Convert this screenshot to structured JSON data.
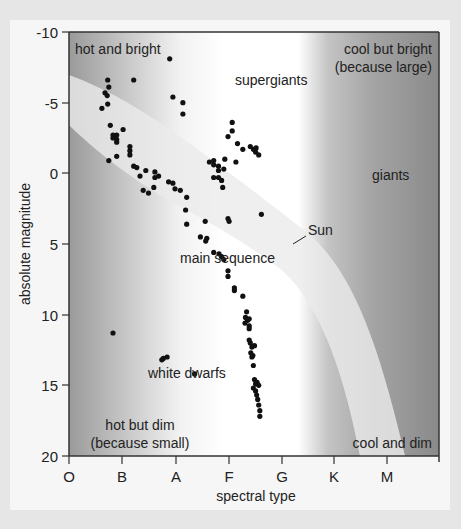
{
  "chart_data": {
    "type": "scatter",
    "title": "",
    "xlabel": "spectral type",
    "ylabel": "absolute magnitude",
    "x_categories": [
      "O",
      "B",
      "A",
      "F",
      "G",
      "K",
      "M"
    ],
    "y_ticks": [
      -10,
      -5,
      0,
      5,
      10,
      15,
      20
    ],
    "ylim": [
      -10,
      20
    ],
    "y_inverted": true,
    "grid": false,
    "legend": null,
    "annotations": {
      "hot_and_bright": "hot and bright",
      "cool_but_bright_1": "cool but bright",
      "cool_but_bright_2": "(because large)",
      "hot_but_dim_1": "hot but dim",
      "hot_but_dim_2": "(because small)",
      "cool_and_dim": "cool and dim",
      "supergiants": "supergiants",
      "giants": "giants",
      "main_sequence": "main sequence",
      "white_dwarfs": "white dwarfs",
      "sun": "Sun"
    },
    "points": [
      {
        "x": 0.62,
        "y": -4.6
      },
      {
        "x": 0.73,
        "y": -6.6
      },
      {
        "x": 0.68,
        "y": -5.7
      },
      {
        "x": 0.72,
        "y": -5.5
      },
      {
        "x": 0.75,
        "y": -6.1
      },
      {
        "x": 0.73,
        "y": -4.9
      },
      {
        "x": 0.78,
        "y": -3.4
      },
      {
        "x": 0.83,
        "y": -2.7
      },
      {
        "x": 0.83,
        "y": -2.5
      },
      {
        "x": 0.9,
        "y": -2.7
      },
      {
        "x": 0.9,
        "y": -2.4
      },
      {
        "x": 0.9,
        "y": -2.2
      },
      {
        "x": 0.75,
        "y": -0.9
      },
      {
        "x": 0.9,
        "y": -1.2
      },
      {
        "x": 1.02,
        "y": -3.1
      },
      {
        "x": 1.22,
        "y": -6.6
      },
      {
        "x": 1.15,
        "y": -1.9
      },
      {
        "x": 1.15,
        "y": -1.6
      },
      {
        "x": 1.15,
        "y": -1.3
      },
      {
        "x": 1.22,
        "y": -0.5
      },
      {
        "x": 1.28,
        "y": -0.4
      },
      {
        "x": 1.34,
        "y": 0.2
      },
      {
        "x": 1.45,
        "y": -0.2
      },
      {
        "x": 1.4,
        "y": 1.2
      },
      {
        "x": 1.5,
        "y": 1.4
      },
      {
        "x": 1.6,
        "y": 1.0
      },
      {
        "x": 1.62,
        "y": -0.1
      },
      {
        "x": 1.62,
        "y": 0.3
      },
      {
        "x": 1.69,
        "y": 0.2
      },
      {
        "x": 1.88,
        "y": 0.6
      },
      {
        "x": 1.96,
        "y": 0.7
      },
      {
        "x": 1.9,
        "y": -8.1
      },
      {
        "x": 1.96,
        "y": -5.4
      },
      {
        "x": 2.15,
        "y": -5.0
      },
      {
        "x": 2.15,
        "y": -4.2
      },
      {
        "x": 2.0,
        "y": 1.1
      },
      {
        "x": 2.1,
        "y": 1.2
      },
      {
        "x": 2.22,
        "y": 1.7
      },
      {
        "x": 2.2,
        "y": 2.6
      },
      {
        "x": 2.22,
        "y": 3.6
      },
      {
        "x": 2.57,
        "y": 3.4
      },
      {
        "x": 2.6,
        "y": 4.6
      },
      {
        "x": 2.58,
        "y": 4.8
      },
      {
        "x": 2.48,
        "y": 4.5
      },
      {
        "x": 3.0,
        "y": 3.2
      },
      {
        "x": 3.02,
        "y": 3.4
      },
      {
        "x": 2.65,
        "y": -0.8
      },
      {
        "x": 2.73,
        "y": -0.6
      },
      {
        "x": 2.73,
        "y": -0.9
      },
      {
        "x": 2.82,
        "y": -0.5
      },
      {
        "x": 2.82,
        "y": 0.3
      },
      {
        "x": 2.73,
        "y": 0.3
      },
      {
        "x": 2.82,
        "y": -0.2
      },
      {
        "x": 2.88,
        "y": 0.5
      },
      {
        "x": 2.92,
        "y": -0.3
      },
      {
        "x": 2.94,
        "y": -1.0
      },
      {
        "x": 2.9,
        "y": 1.0
      },
      {
        "x": 3.0,
        "y": -2.6
      },
      {
        "x": 3.08,
        "y": -3.6
      },
      {
        "x": 3.08,
        "y": -3.0
      },
      {
        "x": 3.15,
        "y": -0.8
      },
      {
        "x": 3.18,
        "y": -2.1
      },
      {
        "x": 3.28,
        "y": -1.7
      },
      {
        "x": 3.42,
        "y": -1.9
      },
      {
        "x": 3.48,
        "y": -1.7
      },
      {
        "x": 3.53,
        "y": -1.8
      },
      {
        "x": 3.52,
        "y": -1.5
      },
      {
        "x": 3.58,
        "y": -1.3
      },
      {
        "x": 3.63,
        "y": 2.9
      },
      {
        "x": 2.73,
        "y": 5.6
      },
      {
        "x": 2.83,
        "y": 5.7
      },
      {
        "x": 2.88,
        "y": 5.9
      },
      {
        "x": 2.92,
        "y": 6.1
      },
      {
        "x": 3.0,
        "y": 6.9
      },
      {
        "x": 3.0,
        "y": 7.3
      },
      {
        "x": 3.12,
        "y": 8.3
      },
      {
        "x": 3.12,
        "y": 8.1
      },
      {
        "x": 3.28,
        "y": 8.7
      },
      {
        "x": 3.33,
        "y": 10.2
      },
      {
        "x": 3.35,
        "y": 9.8
      },
      {
        "x": 3.37,
        "y": 10.4
      },
      {
        "x": 3.4,
        "y": 10.3
      },
      {
        "x": 3.32,
        "y": 10.6
      },
      {
        "x": 3.4,
        "y": 10.8
      },
      {
        "x": 3.4,
        "y": 11.0
      },
      {
        "x": 3.4,
        "y": 11.8
      },
      {
        "x": 3.42,
        "y": 12.0
      },
      {
        "x": 3.45,
        "y": 12.3
      },
      {
        "x": 3.5,
        "y": 12.2
      },
      {
        "x": 3.43,
        "y": 12.7
      },
      {
        "x": 3.45,
        "y": 13.0
      },
      {
        "x": 3.47,
        "y": 12.9
      },
      {
        "x": 3.48,
        "y": 13.6
      },
      {
        "x": 3.5,
        "y": 14.6
      },
      {
        "x": 3.52,
        "y": 14.9
      },
      {
        "x": 3.55,
        "y": 14.8
      },
      {
        "x": 3.48,
        "y": 15.2
      },
      {
        "x": 3.52,
        "y": 15.4
      },
      {
        "x": 3.54,
        "y": 15.7
      },
      {
        "x": 3.58,
        "y": 15.0
      },
      {
        "x": 3.56,
        "y": 16.0
      },
      {
        "x": 3.58,
        "y": 16.4
      },
      {
        "x": 3.6,
        "y": 16.8
      },
      {
        "x": 3.6,
        "y": 17.2
      },
      {
        "x": 0.83,
        "y": 11.3
      },
      {
        "x": 1.75,
        "y": 13.2
      },
      {
        "x": 1.85,
        "y": 13.0
      },
      {
        "x": 1.78,
        "y": 13.1
      },
      {
        "x": 2.37,
        "y": 14.2
      }
    ]
  },
  "axes": {
    "x_ticks": [
      "O",
      "B",
      "A",
      "F",
      "G",
      "K",
      "M"
    ],
    "y_ticks": [
      "-10",
      "-5",
      "0",
      "5",
      "10",
      "15",
      "20"
    ],
    "xlabel": "spectral type",
    "ylabel": "absolute magnitude"
  },
  "colors": {
    "dot": "#111111",
    "frame": "#333333",
    "band": "#dcdcdc",
    "dark_gray": "#8e8e8e",
    "card": "#f6f6f6"
  }
}
